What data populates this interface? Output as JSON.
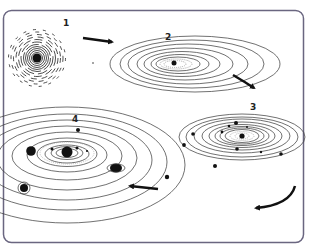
{
  "diagram": {
    "type": "process",
    "frame": {
      "border_color": "#6a6680",
      "corner_radius": 8
    },
    "stages": [
      {
        "label": "1",
        "description": "spherical nebula cloud with dense core"
      },
      {
        "label": "2",
        "description": "flattened rotating disk with central star"
      },
      {
        "label": "3",
        "description": "disk with forming planetesimals"
      },
      {
        "label": "4",
        "description": "planetary system with planets on orbits"
      }
    ],
    "arrows": [
      {
        "from": "1",
        "to": "2"
      },
      {
        "from": "2",
        "to": "3"
      },
      {
        "from": "3",
        "to": "4"
      }
    ],
    "colors": {
      "ink": "#111111",
      "line": "#333333",
      "dotted": "#9a9a9a"
    }
  }
}
